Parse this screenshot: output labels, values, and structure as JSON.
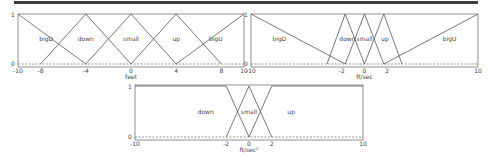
{
  "colors": {
    "line": "#555555",
    "frame": "#777777",
    "dashed": "#666666",
    "topbar": "#3a3a3a",
    "text": "#444444"
  },
  "chart_data": [
    {
      "type": "line",
      "title": "",
      "xlabel": "feet",
      "ylabel": "",
      "xlim": [
        -10,
        10
      ],
      "ylim": [
        0,
        1
      ],
      "xticks": [
        "-10",
        "-8",
        "-4",
        "0",
        "4",
        "8",
        "10"
      ],
      "yticks": [
        "0",
        "1"
      ],
      "grid": false,
      "legend_position": "inline labels",
      "series": [
        {
          "name": "bigD",
          "x": [
            -10,
            -4
          ],
          "y": [
            1,
            0
          ],
          "label_x": -7.5
        },
        {
          "name": "down",
          "x": [
            -8,
            -4,
            0
          ],
          "y": [
            0,
            1,
            0
          ],
          "label_x": -4
        },
        {
          "name": "small",
          "x": [
            -4,
            0,
            4
          ],
          "y": [
            0,
            1,
            0
          ],
          "label_x": 0
        },
        {
          "name": "up",
          "x": [
            0,
            4,
            8
          ],
          "y": [
            0,
            1,
            0
          ],
          "label_x": 4
        },
        {
          "name": "bigU",
          "x": [
            4,
            10
          ],
          "y": [
            0,
            1
          ],
          "label_x": 7.5
        }
      ]
    },
    {
      "type": "line",
      "title": "",
      "xlabel": "ft/sec",
      "ylabel": "",
      "xlim": [
        -10,
        10
      ],
      "ylim": [
        0,
        1
      ],
      "xticks": [
        "-10",
        "-2",
        "0",
        "2",
        "10"
      ],
      "yticks": [
        "0",
        "1"
      ],
      "grid": false,
      "legend_position": "inline labels",
      "series": [
        {
          "name": "bigD",
          "x": [
            -10,
            -1.7
          ],
          "y": [
            1,
            0
          ],
          "label_x": -7.5
        },
        {
          "name": "down",
          "x": [
            -3.3,
            -1.7,
            0
          ],
          "y": [
            0,
            1,
            0
          ],
          "label_x": -1.5
        },
        {
          "name": "small",
          "x": [
            -1.7,
            0,
            1.7
          ],
          "y": [
            0,
            1,
            0
          ],
          "label_x": 0
        },
        {
          "name": "up",
          "x": [
            0,
            1.7,
            3.3
          ],
          "y": [
            0,
            1,
            0
          ],
          "label_x": 1.8
        },
        {
          "name": "bigU",
          "x": [
            1.7,
            10
          ],
          "y": [
            0,
            1
          ],
          "label_x": 7.5
        }
      ]
    },
    {
      "type": "line",
      "title": "",
      "xlabel": "ft/sec²",
      "ylabel": "",
      "xlim": [
        -10,
        10
      ],
      "ylim": [
        0,
        1
      ],
      "xticks": [
        "-10",
        "-2",
        "0",
        "2",
        "10"
      ],
      "yticks": [
        "0",
        "1"
      ],
      "grid": false,
      "legend_position": "inline labels",
      "series": [
        {
          "name": "down",
          "x": [
            -10,
            -2,
            0
          ],
          "y": [
            1,
            1,
            0
          ],
          "label_x": -3.8
        },
        {
          "name": "small",
          "x": [
            -2,
            0,
            2
          ],
          "y": [
            0,
            1,
            0
          ],
          "label_x": 0
        },
        {
          "name": "up",
          "x": [
            0,
            2,
            10
          ],
          "y": [
            0,
            1,
            1
          ],
          "label_x": 3.7
        }
      ]
    }
  ],
  "plots": [
    {
      "frame": {
        "x": 18,
        "y": 14,
        "w": 226,
        "h": 53
      },
      "y_one": 14,
      "y_zero": 64
    },
    {
      "frame": {
        "x": 251,
        "y": 14,
        "w": 227,
        "h": 53
      },
      "y_one": 14,
      "y_zero": 64
    },
    {
      "frame": {
        "x": 135,
        "y": 85,
        "w": 228,
        "h": 55
      },
      "y_one": 86,
      "y_zero": 137
    }
  ]
}
